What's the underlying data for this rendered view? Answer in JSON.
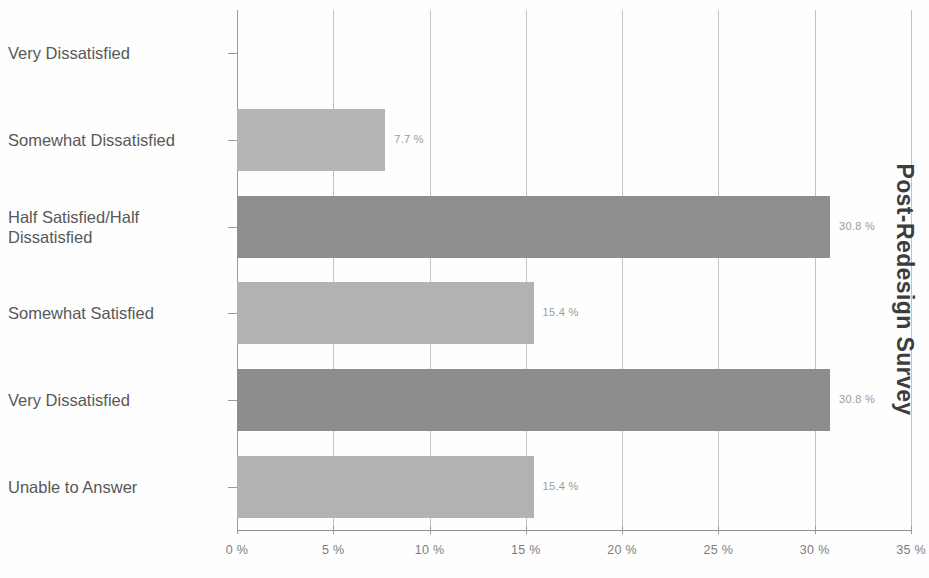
{
  "chart_data": {
    "type": "bar",
    "orientation": "horizontal",
    "title": "Post-Redesign Survey",
    "title_position": "right-rotated",
    "xlabel": "",
    "ylabel": "",
    "xlim": [
      0,
      35
    ],
    "grid": true,
    "legend": false,
    "categories": [
      "Very Dissatisfied",
      "Somewhat Dissatisfied",
      "Half Satisfied/Half\nDissatisfied",
      "Somewhat Satisfied",
      "Very Dissatisfied",
      "Unable to Answer"
    ],
    "values": [
      0,
      7.7,
      30.8,
      15.4,
      30.8,
      15.4
    ],
    "value_labels": [
      "",
      "7.7 %",
      "30.8 %",
      "15.4 %",
      "30.8 %",
      "15.4 %"
    ],
    "bar_colors": [
      "#b3b3b3",
      "#b5b5b5",
      "#8f8f8f",
      "#b2b2b2",
      "#8d8d8d",
      "#b2b2b2"
    ],
    "x_ticks": [
      0,
      5,
      10,
      15,
      20,
      25,
      30,
      35
    ],
    "x_tick_labels": [
      "0 %",
      "5 %",
      "10 %",
      "15 %",
      "20 %",
      "25 %",
      "30 %",
      "35 %"
    ],
    "colors": {
      "light_bar": "#b3b3b3",
      "dark_bar": "#8e8e8e",
      "gridline": "#c2c2c2",
      "axis": "#8f8f8f",
      "category_text": "#585858",
      "tick_text": "#7d7d7d",
      "value_label_text": "#9b9b9b",
      "title_text": "#3d3d3d",
      "background": "#fefefe"
    }
  }
}
